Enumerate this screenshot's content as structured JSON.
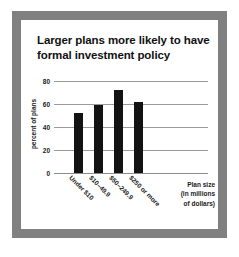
{
  "figure": {
    "frame_color": "#808080",
    "panel_color": "#ffffff"
  },
  "chart_data": {
    "type": "bar",
    "title": "Larger plans more likely to have formal investment policy",
    "title_line1": "Larger plans more likely to have",
    "title_line2": "formal investment policy",
    "xlabel": "Plan size (in millions of dollars)",
    "xlabel_line1": "Plan size",
    "xlabel_line2": "(in millions",
    "xlabel_line3": "of dollars)",
    "ylabel": "percent of plans",
    "categories": [
      "Under $10",
      "$10–49.9",
      "$50–249.9",
      "$250 or more"
    ],
    "values": [
      52,
      59.5,
      72,
      62
    ],
    "ylim": [
      0,
      80
    ],
    "yticks": [
      80,
      60,
      40,
      20,
      0
    ],
    "grid": true,
    "legend": null,
    "bar_color": "#131313",
    "grid_color": "#9a9a9a"
  }
}
